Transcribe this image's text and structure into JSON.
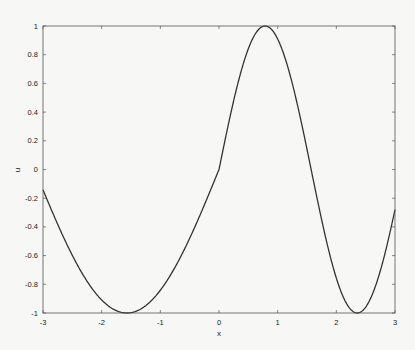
{
  "chart_data": {
    "type": "line",
    "title": "",
    "xlabel": "x",
    "ylabel": "u",
    "xlim": [
      -3,
      3
    ],
    "ylim": [
      -1,
      1
    ],
    "xticks": [
      "-3",
      "-2",
      "-1",
      "0",
      "1",
      "2",
      "3"
    ],
    "yticks": [
      "-1",
      "-0.8",
      "-0.6",
      "-0.4",
      "-0.2",
      "0",
      "0.2",
      "0.4",
      "0.6",
      "0.8",
      "1"
    ],
    "grid": false,
    "legend": null,
    "series": [
      {
        "name": "u",
        "color": "#333333",
        "x": [
          -3.0,
          -2.75,
          -2.5,
          -2.25,
          -2.0,
          -1.75,
          -1.57,
          -1.25,
          -1.0,
          -0.75,
          -0.5,
          -0.25,
          0.0,
          0.25,
          0.5,
          0.785,
          1.0,
          1.25,
          1.5,
          1.75,
          2.0,
          2.356,
          2.5,
          2.75,
          3.0
        ],
        "y": [
          -0.141,
          -0.382,
          -0.598,
          -0.778,
          -0.909,
          -0.984,
          -1.0,
          -0.949,
          -0.841,
          -0.682,
          -0.479,
          -0.247,
          0.0,
          0.479,
          0.841,
          1.0,
          0.909,
          0.598,
          0.141,
          -0.351,
          -0.757,
          -1.0,
          -0.959,
          -0.706,
          -0.279
        ]
      }
    ]
  }
}
